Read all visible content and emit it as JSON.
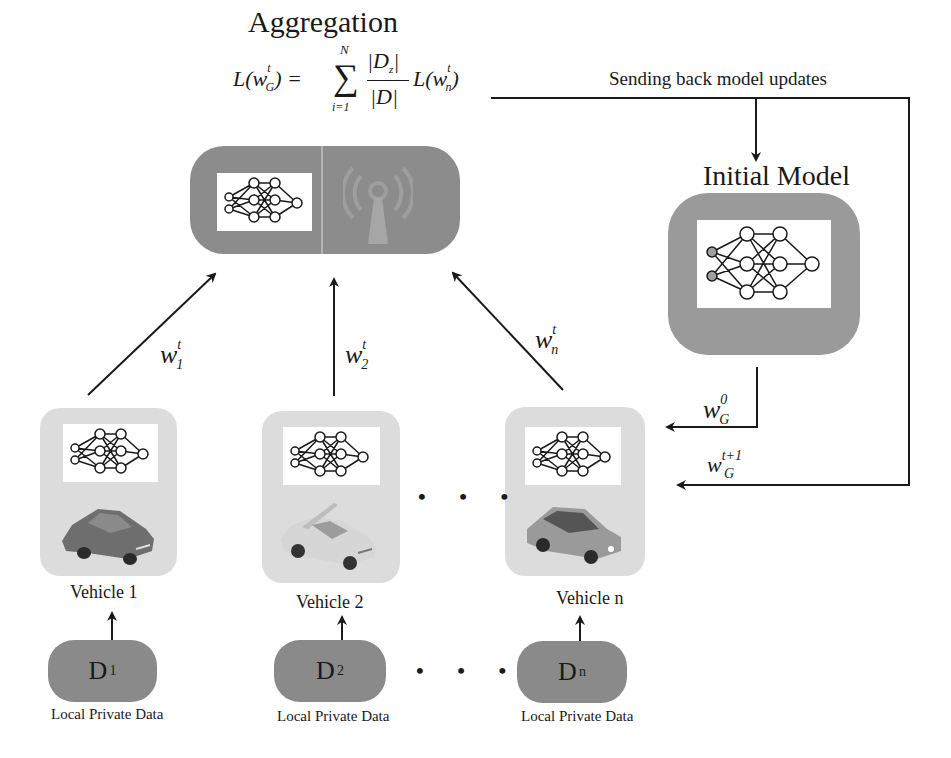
{
  "aggregation": {
    "title": "Aggregation",
    "formula": {
      "lhs": "L(w",
      "lhs_sub": "G",
      "lhs_sup": "t",
      "sum_upper": "N",
      "sum_lower": "i=1",
      "numerator": "|D",
      "numerator_sub": "z",
      "denominator": "|D|",
      "rhs": "L(w",
      "rhs_sub": "n",
      "rhs_sup": "t"
    },
    "icons": [
      "neural-network-icon",
      "antenna-tower-icon"
    ]
  },
  "feedback": {
    "label": "Sending back model updates"
  },
  "initial_model": {
    "title": "Initial Model",
    "icon": "neural-network-icon"
  },
  "uploads": [
    {
      "w": "w",
      "sub": "1",
      "sup": "t"
    },
    {
      "w": "w",
      "sub": "2",
      "sup": "t"
    },
    {
      "w": "w",
      "sub": "n",
      "sup": "t"
    }
  ],
  "downlinks": [
    {
      "w": "w",
      "sub": "G",
      "sup": "0"
    },
    {
      "w": "w",
      "sub": "G",
      "sup": "t+1"
    }
  ],
  "vehicles": [
    {
      "label": "Vehicle 1",
      "car_color": "#6e6e6e",
      "data": {
        "letter": "D",
        "sub": "1",
        "caption": "Local Private Data"
      }
    },
    {
      "label": "Vehicle 2",
      "car_color": "#cfcfcf",
      "data": {
        "letter": "D",
        "sub": "2",
        "caption": "Local Private Data"
      }
    },
    {
      "label": "Vehicle n",
      "car_color": "#9a9a9a",
      "data": {
        "letter": "D",
        "sub": "n",
        "caption": "Local Private Data"
      }
    }
  ],
  "ellipsis": "• • •",
  "colors": {
    "dark_box": "#8c8c8c",
    "light_box": "#dcdcdc",
    "line": "#1a1a1a",
    "background": "#ffffff"
  }
}
